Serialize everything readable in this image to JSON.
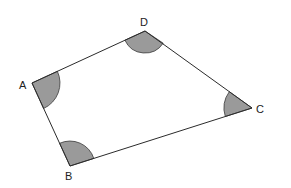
{
  "diagram": {
    "type": "quadrilateral",
    "vertices": {
      "A": {
        "label": "A",
        "x": 32,
        "y": 83
      },
      "B": {
        "label": "B",
        "x": 70,
        "y": 166
      },
      "C": {
        "label": "C",
        "x": 252,
        "y": 108
      },
      "D": {
        "label": "D",
        "x": 145,
        "y": 31
      }
    },
    "edges": [
      [
        "A",
        "D"
      ],
      [
        "D",
        "C"
      ],
      [
        "C",
        "B"
      ],
      [
        "B",
        "A"
      ]
    ],
    "shaded_angles": [
      "A",
      "B",
      "C",
      "D"
    ],
    "colors": {
      "edge": "#2b2b2b",
      "angle_fill": "#9a9a9a",
      "background": "#ffffff"
    }
  }
}
